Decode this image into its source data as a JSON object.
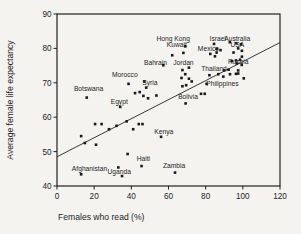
{
  "figure": {
    "background": "#f4f3f0",
    "ink": "#222222",
    "frame": {
      "left": 57,
      "right": 280,
      "top": 14,
      "bottom": 186
    }
  },
  "chart_data": {
    "type": "scatter",
    "title": "",
    "xlabel": "Females who read (%)",
    "ylabel": "Average female life expectancy",
    "xlim": [
      0,
      120
    ],
    "ylim": [
      40,
      90
    ],
    "xticks": [
      0,
      20,
      40,
      60,
      80,
      100,
      120
    ],
    "yticks": [
      40,
      50,
      60,
      70,
      80,
      90
    ],
    "grid": false,
    "legend": "none",
    "marker": "filled-square",
    "trend_line": {
      "x1": 0,
      "y1": 48.5,
      "x2": 120,
      "y2": 81.7
    },
    "labeled_points": [
      {
        "name": "Afghanistan",
        "x": 13,
        "y": 43.4,
        "label_x": 17.5,
        "label_y": 45.1
      },
      {
        "name": "Uganda",
        "x": 35,
        "y": 42.9,
        "label_x": 33.5,
        "label_y": 44.2
      },
      {
        "name": "Haiti",
        "x": 45.5,
        "y": 45.8,
        "label_x": 46.5,
        "label_y": 47.8
      },
      {
        "name": "Zambia",
        "x": 63.5,
        "y": 43.9,
        "label_x": 63,
        "label_y": 45.8
      },
      {
        "name": "Kenya",
        "x": 56,
        "y": 54.3,
        "label_x": 57.5,
        "label_y": 55.8
      },
      {
        "name": "Botswana",
        "x": 16,
        "y": 65.7,
        "label_x": 17,
        "label_y": 68.3
      },
      {
        "name": "Egypt",
        "x": 34,
        "y": 63,
        "label_x": 33.5,
        "label_y": 64.6
      },
      {
        "name": "Morocco",
        "x": 38.5,
        "y": 69.7,
        "label_x": 36.5,
        "label_y": 72.3
      },
      {
        "name": "Syria",
        "x": 48,
        "y": 68.6,
        "label_x": 50,
        "label_y": 70.0
      },
      {
        "name": "Bahrain",
        "x": 57.2,
        "y": 75.1,
        "label_x": 53,
        "label_y": 75.7
      },
      {
        "name": "Jordan",
        "x": 71,
        "y": 74.4,
        "label_x": 68,
        "label_y": 75.7
      },
      {
        "name": "Hong Kong",
        "x": 69,
        "y": 80.6,
        "label_x": 62.5,
        "label_y": 82.7
      },
      {
        "name": "Kuwait",
        "x": 68,
        "y": 78.7,
        "label_x": 64.5,
        "label_y": 81.2
      },
      {
        "name": "Bolivia",
        "x": 69.2,
        "y": 64,
        "label_x": 70.5,
        "label_y": 66.1
      },
      {
        "name": "Philippines",
        "x": 80.5,
        "y": 69.7,
        "label_x": 89,
        "label_y": 69.7
      },
      {
        "name": "Mexico",
        "x": 82.5,
        "y": 78.4,
        "label_x": 81.5,
        "label_y": 79.9
      },
      {
        "name": "Israel",
        "x": 84.5,
        "y": 81.3,
        "label_x": 86.5,
        "label_y": 82.7
      },
      {
        "name": "Australia",
        "x": 96.5,
        "y": 81.5,
        "label_x": 97,
        "label_y": 82.7
      },
      {
        "name": "USA",
        "x": 97.5,
        "y": 80,
        "label_x": 97,
        "label_y": 81.1
      },
      {
        "name": "Russia",
        "x": 96.7,
        "y": 75.6,
        "label_x": 97.5,
        "label_y": 76.0
      },
      {
        "name": "Thailand",
        "x": 90,
        "y": 73.6,
        "label_x": 84.5,
        "label_y": 74.2
      }
    ],
    "unlabeled_points": [
      [
        33,
        45.4
      ],
      [
        38,
        49.3
      ],
      [
        13,
        54.5
      ],
      [
        15,
        52.5
      ],
      [
        20.5,
        58
      ],
      [
        24,
        58
      ],
      [
        21,
        52
      ],
      [
        28,
        56.5
      ],
      [
        32,
        57.5
      ],
      [
        37.5,
        58.8
      ],
      [
        41,
        56.5
      ],
      [
        44,
        58
      ],
      [
        46,
        58
      ],
      [
        42,
        67
      ],
      [
        44.5,
        67.3
      ],
      [
        46.5,
        66.2
      ],
      [
        49,
        65.5
      ],
      [
        53.5,
        66.3
      ],
      [
        47,
        70.4
      ],
      [
        62,
        78
      ],
      [
        67.5,
        73.7
      ],
      [
        69,
        72.5
      ],
      [
        67,
        71.4
      ],
      [
        71,
        71.2
      ],
      [
        72.5,
        70.4
      ],
      [
        67.5,
        69
      ],
      [
        69.5,
        69.3
      ],
      [
        77.5,
        66.8
      ],
      [
        79.5,
        66.8
      ],
      [
        85.9,
        79.9
      ],
      [
        85.9,
        78.8
      ],
      [
        88,
        79.5
      ],
      [
        85,
        77.7
      ],
      [
        93,
        81.8
      ],
      [
        99,
        81.2
      ],
      [
        99.5,
        79.3
      ],
      [
        95,
        78.8
      ],
      [
        99.5,
        77.6
      ],
      [
        94,
        76.3
      ],
      [
        96.3,
        76.5
      ],
      [
        98.5,
        76.7
      ],
      [
        99.4,
        75.2
      ],
      [
        92.3,
        73.8
      ],
      [
        97.5,
        73.6
      ],
      [
        97.5,
        72.7
      ],
      [
        82,
        72.2
      ],
      [
        86.8,
        72.5
      ],
      [
        93.1,
        72.5
      ],
      [
        96.3,
        72.6
      ],
      [
        89.5,
        71.8
      ],
      [
        100.5,
        71.3
      ]
    ]
  }
}
